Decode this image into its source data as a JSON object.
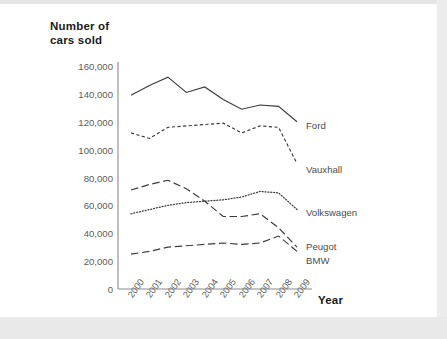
{
  "chart_data": {
    "type": "line",
    "title": "",
    "ylabel": "Number of\ncars sold",
    "xlabel": "Year",
    "categories": [
      "2000",
      "2001",
      "2002",
      "2003",
      "2004",
      "2005",
      "2006",
      "2007",
      "2008",
      "2009"
    ],
    "ylim": [
      0,
      160000
    ],
    "ytick_labels": [
      "160,000",
      "140,000",
      "120,000",
      "100,000",
      "80,000",
      "60,000",
      "40,000",
      "20,000",
      "0"
    ],
    "ytick_values": [
      160000,
      140000,
      120000,
      100000,
      80000,
      60000,
      40000,
      20000,
      0
    ],
    "grid": false,
    "legend_position": "right-inline",
    "series": [
      {
        "name": "Ford",
        "style": "solid",
        "color": "#3b3b3b",
        "values": [
          139000,
          146000,
          152000,
          141000,
          145000,
          136000,
          129000,
          132000,
          131000,
          120000
        ]
      },
      {
        "name": "Vauxhall",
        "style": "dashed-small",
        "color": "#3b3b3b",
        "values": [
          112000,
          108000,
          116000,
          117000,
          118000,
          119000,
          112000,
          117000,
          116000,
          90000
        ]
      },
      {
        "name": "Volkswagen",
        "style": "dotted",
        "color": "#3b3b3b",
        "values": [
          54000,
          57000,
          60000,
          62000,
          63000,
          64000,
          66000,
          70000,
          69000,
          57000
        ]
      },
      {
        "name": "Peugot",
        "style": "dashed-long",
        "color": "#3b3b3b",
        "values": [
          71000,
          75000,
          78000,
          72000,
          63000,
          52000,
          52000,
          54000,
          44000,
          30000
        ]
      },
      {
        "name": "BMW",
        "style": "dashed-long",
        "color": "#3b3b3b",
        "values": [
          25000,
          27000,
          30000,
          31000,
          32000,
          33000,
          32000,
          33000,
          38000,
          27000
        ]
      }
    ]
  },
  "labels": {
    "ford": "Ford",
    "vauxhall": "Vauxhall",
    "volkswagen": "Volkswagen",
    "peugot": "Peugot",
    "bmw": "BMW",
    "y_axis_title": "Number of\ncars sold",
    "x_axis_title": "Year"
  }
}
